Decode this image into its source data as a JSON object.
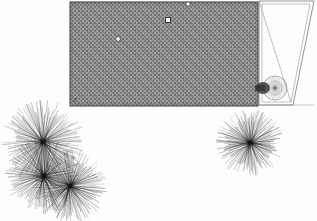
{
  "document": {
    "type": "scanned-plan-drawing",
    "background_color": "#fdfdfc",
    "ink_color": "#2b2b2b",
    "width": 317,
    "height": 221
  },
  "plan": {
    "hatched_area": {
      "name": "hatched-rectangle",
      "fill_description": "dithered gray stipple",
      "fill_color": "#8f8f8f",
      "border_color": "#4a4a4a",
      "x": 70,
      "y": 2,
      "width": 188,
      "height": 104,
      "label": "",
      "label_x": 165,
      "label_y": 46
    },
    "annex": {
      "name": "trapezoid-annex",
      "label": "",
      "label_x": 276,
      "label_y": 48,
      "stroke_color": "#7a7a7a"
    },
    "markers": [
      {
        "name": "marker-dot-upper",
        "shape": "circle",
        "x": 188,
        "y": 4,
        "r": 2.2
      },
      {
        "name": "marker-square-mid",
        "shape": "square",
        "x": 168,
        "y": 20,
        "size": 5
      },
      {
        "name": "marker-dot-left",
        "shape": "circle",
        "x": 118,
        "y": 39,
        "r": 2.4
      },
      {
        "name": "marker-tick-corner",
        "shape": "tick",
        "x": 75,
        "y": 100
      }
    ],
    "fan": {
      "name": "radial-fan-wheel",
      "cx": 275,
      "cy": 88,
      "r": 12,
      "spokes": 28,
      "hub_x": 263,
      "hub_y": 88
    }
  },
  "starbursts": [
    {
      "name": "starburst-upper-left",
      "cx": 43,
      "cy": 142,
      "r": 41,
      "rays": 150
    },
    {
      "name": "starburst-lower-left",
      "cx": 44,
      "cy": 176,
      "r": 38,
      "rays": 150
    },
    {
      "name": "starburst-lower-center",
      "cx": 70,
      "cy": 186,
      "r": 36,
      "rays": 150
    },
    {
      "name": "starburst-right",
      "cx": 250,
      "cy": 143,
      "r": 33,
      "rays": 150
    }
  ],
  "legend": {
    "caption": ""
  }
}
